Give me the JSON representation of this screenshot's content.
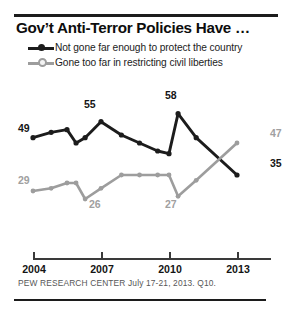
{
  "header": {
    "title": "Gov’t Anti-Terror Policies Have …"
  },
  "legend": {
    "position": "top",
    "items": [
      {
        "label": "Not gone far enough to protect the country",
        "color": "#1c1c1c",
        "marker": "filled-dot"
      },
      {
        "label": "Gone too far in restricting civil liberties",
        "color": "#9d9d9d",
        "marker": "open-dot"
      }
    ]
  },
  "axis": {
    "ticks": [
      "2004",
      "2007",
      "2010",
      "2013"
    ]
  },
  "footer": {
    "source": "PEW RESEARCH CENTER July 17-21, 2013. Q10."
  },
  "annotations": {
    "not_far_enough_start": "49",
    "not_far_enough_peak_2007": "55",
    "not_far_enough_peak_2010": "58",
    "not_far_enough_end": "35",
    "gone_too_far_start": "29",
    "gone_too_far_low_2007": "26",
    "gone_too_far_low_2010": "27",
    "gone_too_far_end": "47"
  },
  "chart_data": {
    "type": "line",
    "title": "Gov’t Anti-Terror Policies Have …",
    "xlabel": "",
    "ylabel": "",
    "grid": false,
    "legend_position": "top",
    "xlim": [
      2004,
      2013
    ],
    "ylim": [
      20,
      62
    ],
    "xticks": [
      2004,
      2007,
      2010,
      2013
    ],
    "x": [
      2004,
      2004.8,
      2005.5,
      2005.9,
      2006.3,
      2007,
      2007.9,
      2008.7,
      2009.5,
      2010,
      2010.4,
      2011.2,
      2013
    ],
    "series": [
      {
        "name": "Not gone far enough to protect the country",
        "color": "#1c1c1c",
        "values": [
          49,
          51,
          52,
          47,
          49,
          55,
          50,
          47,
          44,
          43,
          58,
          49,
          35
        ],
        "labeled_points": [
          {
            "x": 2004,
            "value": 49,
            "label": "49",
            "position": "left"
          },
          {
            "x": 2007,
            "value": 55,
            "label": "55",
            "position": "above"
          },
          {
            "x": 2010.4,
            "value": 58,
            "label": "58",
            "position": "above"
          },
          {
            "x": 2013,
            "value": 35,
            "label": "35",
            "position": "right"
          }
        ]
      },
      {
        "name": "Gone too far in restricting civil liberties",
        "color": "#9d9d9d",
        "values": [
          29,
          30,
          32,
          32,
          26,
          30,
          35,
          35,
          35,
          35,
          27,
          33,
          47
        ],
        "labeled_points": [
          {
            "x": 2004,
            "value": 29,
            "label": "29",
            "position": "left"
          },
          {
            "x": 2006.3,
            "value": 26,
            "label": "26",
            "position": "below"
          },
          {
            "x": 2010.4,
            "value": 27,
            "label": "27",
            "position": "below"
          },
          {
            "x": 2013,
            "value": 47,
            "label": "47",
            "position": "right"
          }
        ]
      }
    ]
  }
}
